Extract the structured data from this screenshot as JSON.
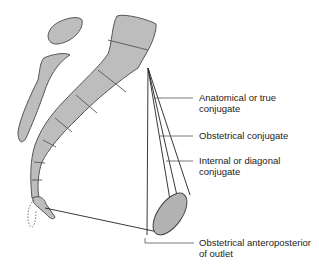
{
  "figure": {
    "colors": {
      "bone_fill": "#bdbdbd",
      "bone_stroke": "#555555",
      "line": "#222222",
      "symphysis_fill": "#b3b3b3",
      "label_text": "#222222"
    }
  },
  "labels": {
    "anatomical": {
      "line1": "Anatomical or true",
      "line2": "conjugate"
    },
    "obstetrical": {
      "line1": "Obstetrical conjugate"
    },
    "diagonal": {
      "line1": "Internal or diagonal",
      "line2": "conjugate"
    },
    "outlet": {
      "line1": "Obstetrical anteroposterior",
      "line2": "of outlet"
    }
  }
}
